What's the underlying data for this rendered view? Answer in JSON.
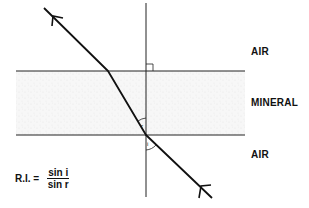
{
  "diagram": {
    "labels": {
      "top_medium": "AIR",
      "middle_medium": "MINERAL",
      "bottom_medium": "AIR",
      "angle_incidence": "i",
      "angle_refraction": "r"
    },
    "formula": {
      "lhs": "R.I. =",
      "numerator": "sin i",
      "denominator": "sin r"
    },
    "colors": {
      "line": "#111111",
      "mineral_fill": "#f2f2f2"
    }
  }
}
